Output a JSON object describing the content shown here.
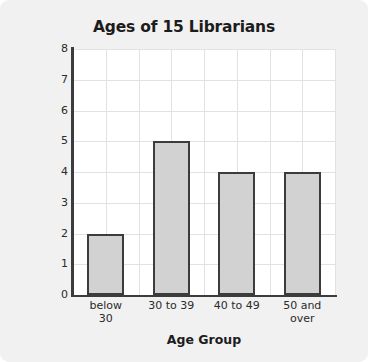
{
  "chart_data": {
    "type": "bar",
    "title": "Ages of 15 Librarians",
    "xlabel": "Age Group",
    "ylabel": "Number of Librarians",
    "categories": [
      "below 30",
      "30 to 39",
      "40 to 49",
      "50 and over"
    ],
    "category_lines": [
      [
        "below",
        "30"
      ],
      [
        "30 to 39"
      ],
      [
        "40 to 49"
      ],
      [
        "50 and",
        "over"
      ]
    ],
    "values": [
      2,
      5,
      4,
      4
    ],
    "ylim": [
      0,
      8
    ],
    "ytick_step": 1,
    "yticks": [
      "8",
      "7",
      "6",
      "5",
      "4",
      "3",
      "2",
      "1",
      "0"
    ],
    "grid": true,
    "legend": "none",
    "total": 15
  },
  "style": {
    "background": "#f1f1f1",
    "plot_background": "#ffffff",
    "bar_fill": "#d2d2d2",
    "bar_outline": "#3c3c3c",
    "axis_color": "#3c3c3c",
    "grid_color": "#e2e2e2",
    "text_color": "#1c1c1c"
  }
}
